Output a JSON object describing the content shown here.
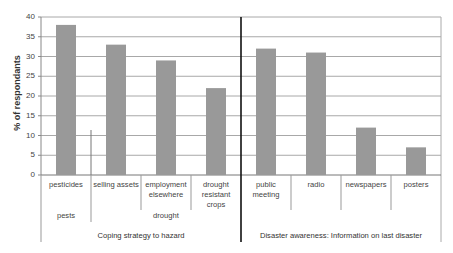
{
  "chart_data": {
    "type": "bar",
    "title": "",
    "ylabel": "% of respondants",
    "xlabel": "",
    "ylim": [
      0,
      40
    ],
    "yticks": [
      0,
      5,
      10,
      15,
      20,
      25,
      30,
      35,
      40
    ],
    "grid": true,
    "legend": null,
    "categories": [
      "pesticides",
      "selling assets",
      "employment elsewhere",
      "drought resistant crops",
      "public meeting",
      "radio",
      "newspapers",
      "posters"
    ],
    "values": [
      38,
      33,
      29,
      22,
      32,
      31,
      12,
      7
    ],
    "bar_color": "#999999",
    "sub_groups": [
      {
        "label": "pests",
        "categories": [
          "pesticides"
        ]
      },
      {
        "label": "drought",
        "categories": [
          "selling assets",
          "employment elsewhere",
          "drought resistant crops"
        ]
      }
    ],
    "panels": [
      {
        "title": "Coping strategy to hazard",
        "categories": [
          "pesticides",
          "selling assets",
          "employment elsewhere",
          "drought resistant crops"
        ]
      },
      {
        "title": "Disaster awareness: Information on last disaster",
        "categories": [
          "public meeting",
          "radio",
          "newspapers",
          "posters"
        ]
      }
    ]
  },
  "labels": {
    "cat_lines": [
      [
        "pesticides"
      ],
      [
        "selling assets"
      ],
      [
        "employment",
        "elsewhere"
      ],
      [
        "drought",
        "resistant",
        "crops"
      ],
      [
        "public",
        "meeting"
      ],
      [
        "radio"
      ],
      [
        "newspapers"
      ],
      [
        "posters"
      ]
    ],
    "group_pests": "pests",
    "group_drought": "drought",
    "panel_left": "Coping strategy to hazard",
    "panel_right": "Disaster awareness: Information on last disaster"
  }
}
